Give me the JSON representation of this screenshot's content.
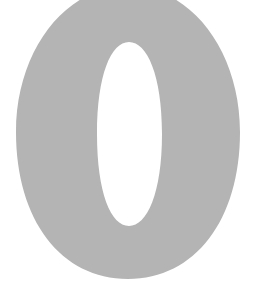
{
  "glyph": {
    "character": "0",
    "fill_color": "#b4b4b4",
    "background_color": "#ffffff"
  }
}
